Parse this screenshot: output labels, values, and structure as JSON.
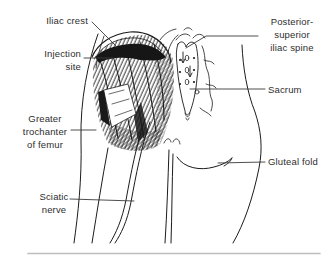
{
  "figure": {
    "kind": "anatomical line illustration",
    "labels": {
      "iliac_crest": [
        "Iliac crest"
      ],
      "injection_site": [
        "Injection",
        "site"
      ],
      "greater_trochanter": [
        "Greater",
        "trochanter",
        "of femur"
      ],
      "sciatic_nerve": [
        "Sciatic",
        "nerve"
      ],
      "posterior_superior_iliac_spine": [
        "Posterior-",
        "superior",
        "iliac spine"
      ],
      "sacrum": [
        "Sacrum"
      ],
      "gluteal_fold": [
        "Gluteal fold"
      ]
    },
    "colors": {
      "background": "#ffffff",
      "ink": "#1c1c1c",
      "leader_line": "#3a3a3a",
      "label_text": "#2e2e2e",
      "bottom_divider": "#bdbdbd"
    }
  }
}
